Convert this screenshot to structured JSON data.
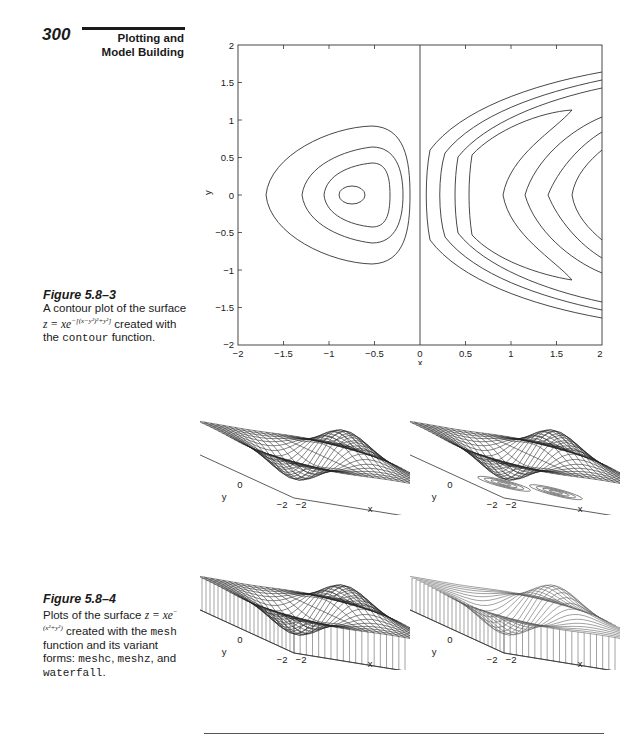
{
  "header": {
    "page_number": "300",
    "running_head_line1": "Plotting and",
    "running_head_line2": "Model Building"
  },
  "figure_5_8_3": {
    "label": "Figure 5.8–3",
    "caption_pre": "A contour plot of the surface",
    "equation": "z = xe",
    "exponent": "−[(x−y²)²+y²]",
    "caption_mid": "created with the",
    "code": "contour",
    "caption_post": "function."
  },
  "figure_5_8_4": {
    "label": "Figure 5.8–4",
    "caption_pre": "Plots of the surface",
    "equation": "z = xe",
    "exponent": "−(x²+y²)",
    "caption_mid1": "created with the",
    "code1": "mesh",
    "caption_mid2": "function and its variant forms:",
    "code2": "meshc",
    "code3": "meshz",
    "caption_mid3": ", and",
    "code4": "waterfall",
    "caption_end": "."
  },
  "chart_data": [
    {
      "type": "contour",
      "title": "",
      "xlabel": "x",
      "ylabel": "y",
      "xlim": [
        -2,
        2
      ],
      "ylim": [
        -2,
        2
      ],
      "xticks": [
        "−2",
        "−1.5",
        "−1",
        "−0.5",
        "0",
        "0.5",
        "1",
        "1.5",
        "2"
      ],
      "yticks": [
        "2",
        "1.5",
        "1",
        "0.5",
        "0",
        "−0.5",
        "−1",
        "−1.5",
        "−2"
      ],
      "function": "z = x*exp(-((x-y^2)^2 + y^2))",
      "notes": "4 closed contours around minimum near (-0.7, 0); several open contours on x>0 side; zero contour along x=0",
      "grid": false
    },
    {
      "type": "surface-mesh",
      "variant": "mesh",
      "xlabel": "x",
      "ylabel": "y",
      "zlabel": "z",
      "zticks": [
        "0.5",
        "0",
        "−0.5"
      ],
      "xticks": [
        "−2",
        "0",
        "2"
      ],
      "yticks": [
        "2",
        "0",
        "−2"
      ],
      "function": "z = x*exp(-(x^2+y^2))"
    },
    {
      "type": "surface-mesh",
      "variant": "meshc",
      "xlabel": "x",
      "ylabel": "y",
      "zlabel": "z",
      "zticks": [
        "0.5",
        "0",
        "−0.5"
      ],
      "xticks": [
        "−2",
        "0",
        "2"
      ],
      "yticks": [
        "2",
        "0",
        "−2"
      ],
      "function": "z = x*exp(-(x^2+y^2))"
    },
    {
      "type": "surface-mesh",
      "variant": "meshz",
      "xlabel": "x",
      "ylabel": "y",
      "zlabel": "z",
      "zticks": [
        "0.5",
        "0",
        "−0.5"
      ],
      "xticks": [
        "−2",
        "0",
        "2"
      ],
      "yticks": [
        "2",
        "0",
        "−2"
      ],
      "function": "z = x*exp(-(x^2+y^2))"
    },
    {
      "type": "surface-mesh",
      "variant": "waterfall",
      "xlabel": "x",
      "ylabel": "y",
      "zlabel": "z",
      "zticks": [
        "0.5",
        "0",
        "−0.5"
      ],
      "xticks": [
        "−2",
        "0",
        "2"
      ],
      "yticks": [
        "2",
        "0",
        "−2"
      ],
      "function": "z = x*exp(-(x^2+y^2))"
    }
  ],
  "axes_labels": {
    "x": "x",
    "y": "y",
    "z": "z"
  }
}
